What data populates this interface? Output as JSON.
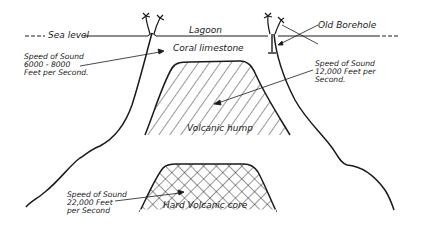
{
  "diagram": {
    "labels": {
      "sea_level": "Sea level",
      "lagoon": "Lagoon",
      "old_borehole": "Old Borehole",
      "coral_limestone": "Coral limestone",
      "volcanic_hump": "Volcanic hump",
      "hard_core": "Hard Volcanic core"
    },
    "annotations": {
      "coral": [
        "Speed of Sound",
        "6000 - 8000",
        "Feet per Second."
      ],
      "hump": [
        "Speed of Sound",
        "12,000 Feet per",
        "Second."
      ],
      "core": [
        "Speed of Sound",
        "22,000 Feet",
        "per Second"
      ]
    },
    "colors": {
      "ink": "#1a1a1a",
      "paper": "#ffffff"
    }
  }
}
